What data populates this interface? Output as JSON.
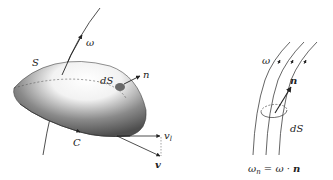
{
  "left_figure": {
    "labels": {
      "omega": "ω",
      "surface": "S",
      "area_element": "dS",
      "normal": "n",
      "curve": "C",
      "velocity_tangential": "v",
      "velocity_tangential_sub": "l",
      "velocity": "v"
    }
  },
  "right_figure": {
    "labels": {
      "omega": "ω",
      "normal": "n",
      "area_element": "dS"
    },
    "equation": {
      "lhs": "ω",
      "lhs_sub": "n",
      "eq": " = ω · ",
      "rhs_bold": "n"
    }
  },
  "colors": {
    "ink": "#222222",
    "surface_dark": "#5a5a5a",
    "surface_light": "#ffffff",
    "patch": "#6a6a6a"
  }
}
